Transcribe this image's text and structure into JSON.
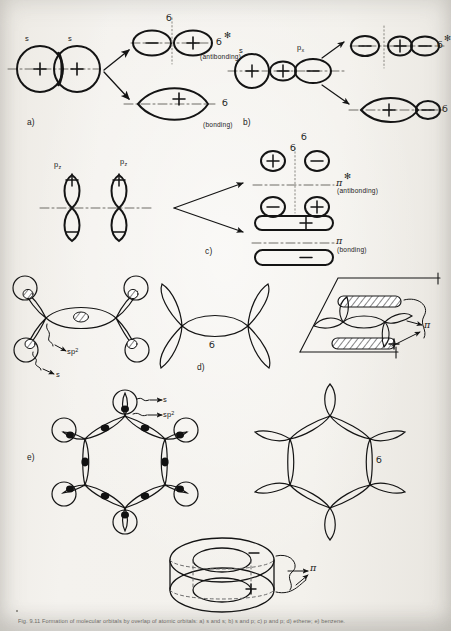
{
  "figure": {
    "panels": [
      {
        "id": "a",
        "label": "a)",
        "description": "s + s overlap giving sigma bonding and sigma antibonding molecular orbitals",
        "atomic_orbitals": [
          "s",
          "s"
        ],
        "atomic_signs": [
          "+",
          "+"
        ],
        "results": [
          {
            "name": "sigma-star",
            "symbol": "б",
            "star": "✻",
            "note": "(antibonding)",
            "lobe_signs": [
              "−",
              "+"
            ]
          },
          {
            "name": "sigma",
            "symbol": "б",
            "star": "",
            "note": "(bonding)",
            "lobe_signs": [
              "+"
            ]
          }
        ]
      },
      {
        "id": "b",
        "label": "b)",
        "description": "s + p overlap giving sigma bonding and sigma antibonding molecular orbitals",
        "atomic_orbitals": [
          "s",
          "p"
        ],
        "p_subscript": "x",
        "atomic_signs": [
          "+",
          "+",
          "−"
        ],
        "results": [
          {
            "name": "sigma-star",
            "symbol": "б",
            "star": "✻",
            "lobe_signs": [
              "−",
              "+",
              "−"
            ]
          },
          {
            "name": "sigma",
            "symbol": "б",
            "star": "",
            "lobe_signs": [
              "+",
              "−"
            ]
          }
        ],
        "axis_symbol": "б"
      },
      {
        "id": "c",
        "label": "c)",
        "description": "p_z + p_z side-on overlap giving pi bonding and pi antibonding molecular orbitals",
        "atomic_orbitals": [
          "p",
          "p"
        ],
        "p_subscript": "z",
        "atomic_signs": [
          "+",
          "−",
          "+",
          "−"
        ],
        "axis_symbol": "б",
        "results": [
          {
            "name": "pi-star",
            "symbol": "π",
            "star": "✻",
            "note": "(antibonding)",
            "lobe_signs": [
              "+",
              "−"
            ]
          },
          {
            "name": "pi",
            "symbol": "π",
            "star": "",
            "note": "(bonding)",
            "lobe_signs": [
              "−",
              "+",
              "+",
              "−"
            ]
          }
        ]
      },
      {
        "id": "d",
        "label": "d)",
        "description": "Ethene: sp2 sigma framework, sigma skeleton, and pi cloud above and below the plane",
        "orbital_labels": [
          "sp",
          "s"
        ],
        "sp_superscript": "2",
        "sigma_symbol": "б",
        "pi_symbol": "π"
      },
      {
        "id": "e",
        "label": "e)",
        "description": "Benzene: sp2 sigma framework, sigma skeleton of the ring, and delocalised pi doughnut clouds",
        "orbital_labels": [
          "s",
          "sp"
        ],
        "sp_superscript": "2",
        "sigma_symbol": "б",
        "pi_symbol": "π",
        "pi_cloud_signs": [
          "−",
          "+"
        ]
      }
    ],
    "symbols": {
      "sigma": "б",
      "pi": "π",
      "star": "✻",
      "plus": "+",
      "minus": "−",
      "antibonding": "(antibonding)",
      "bonding": "(bonding)"
    },
    "caption": "Fig. 9.11  Formation of molecular orbitals by overlap of atomic orbitals: a) s and s; b) s and p; c) p and p; d) ethene; e) benzene."
  },
  "colors": {
    "ink": "#141414",
    "paper": "#f2f0ec",
    "dash": "#7a7872",
    "hatch": "#2b2b2b"
  }
}
